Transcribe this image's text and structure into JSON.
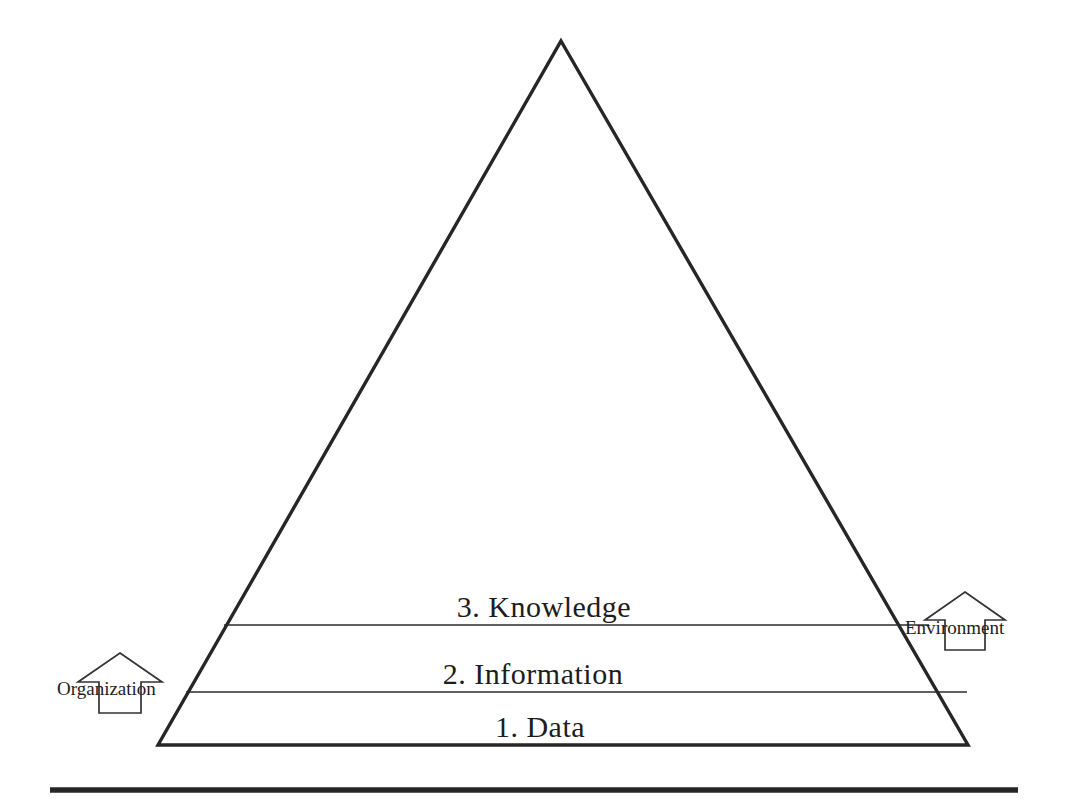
{
  "diagram": {
    "type": "pyramid",
    "background_color": "#ffffff",
    "line_color": "#1d1d1d",
    "tiers": [
      {
        "level": "3",
        "label": "3. Knowledge"
      },
      {
        "level": "2",
        "label": "2. Information"
      },
      {
        "level": "1",
        "label": "1. Data"
      }
    ],
    "side_annotations": [
      {
        "label": "Organization",
        "side": "left",
        "arrow_direction": "up",
        "arrow_style": "outline"
      },
      {
        "label": "Environment",
        "side": "right",
        "arrow_direction": "up",
        "arrow_style": "outline"
      }
    ],
    "footer_rule": {
      "present": true,
      "style": "thick-horizontal-rule"
    }
  }
}
